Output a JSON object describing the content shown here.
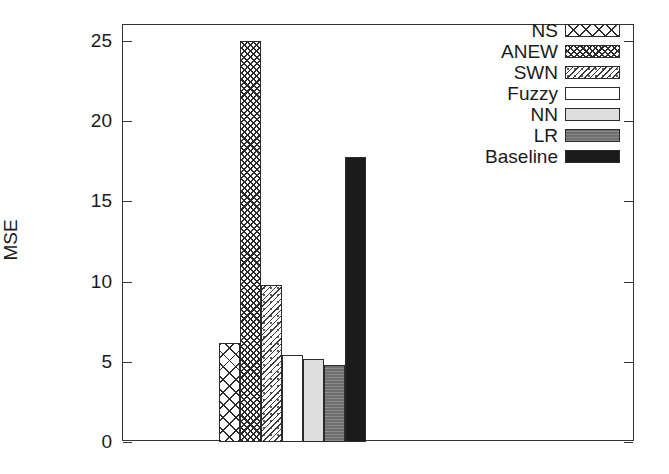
{
  "chart_data": {
    "type": "bar",
    "title": "",
    "xlabel": "",
    "ylabel": "MSE",
    "ylim": [
      0,
      26
    ],
    "yticks": [
      0,
      5,
      10,
      15,
      20,
      25
    ],
    "ytick_labels": [
      "0",
      "5",
      "10",
      "15",
      "20",
      "25"
    ],
    "grid": false,
    "legend_position": "top-right",
    "categories": [
      "NS",
      "ANEW",
      "SWN",
      "Fuzzy",
      "NN",
      "LR",
      "Baseline"
    ],
    "values": [
      6.2,
      25.0,
      9.8,
      5.4,
      5.2,
      4.8,
      17.8
    ],
    "series": [
      {
        "name": "MSE",
        "values": [
          6.2,
          25.0,
          9.8,
          5.4,
          5.2,
          4.8,
          17.8
        ]
      }
    ],
    "bar_fills": [
      "xhatch-large",
      "xhatch-dense",
      "speckle",
      "empty",
      "light-gray",
      "mid-gray",
      "black"
    ],
    "annotations": []
  },
  "axes": {
    "y_label": "MSE",
    "y_tick_labels": [
      "25",
      "20",
      "15",
      "10",
      "5",
      "0"
    ]
  },
  "legend": {
    "entries": [
      {
        "label": "NS",
        "fill": "xhatch-large"
      },
      {
        "label": "ANEW",
        "fill": "xhatch-dense"
      },
      {
        "label": "SWN",
        "fill": "speckle"
      },
      {
        "label": "Fuzzy",
        "fill": "empty"
      },
      {
        "label": "NN",
        "fill": "light-gray"
      },
      {
        "label": "LR",
        "fill": "mid-gray"
      },
      {
        "label": "Baseline",
        "fill": "black"
      }
    ]
  },
  "colors": {
    "axis": "#333333",
    "text": "#1a1a1a",
    "background": "#ffffff",
    "light_gray": "#dedede",
    "mid_gray": "#6e6e6e",
    "black_fill": "#1b1b1b"
  }
}
